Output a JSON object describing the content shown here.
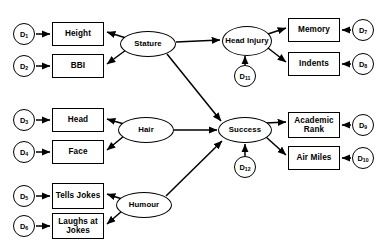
{
  "diagram": {
    "stroke_color": "#000000",
    "fill_color": "#ffffff"
  },
  "latent_factors": [
    {
      "id": "stature",
      "label": "Stature",
      "cx": 148,
      "cy": 44,
      "rx": 28,
      "ry": 13
    },
    {
      "id": "hair",
      "label": "Hair",
      "cx": 146,
      "cy": 130,
      "rx": 28,
      "ry": 13
    },
    {
      "id": "humour",
      "label": "Humour",
      "cx": 144,
      "cy": 205,
      "rx": 28,
      "ry": 13
    },
    {
      "id": "head-injury",
      "label": "Head Injury",
      "cx": 247,
      "cy": 41,
      "rx": 25,
      "ry": 15
    },
    {
      "id": "success",
      "label": "Success",
      "cx": 245,
      "cy": 130,
      "rx": 27,
      "ry": 13
    }
  ],
  "indicators": [
    {
      "id": "height",
      "label": "Height",
      "x": 52,
      "y": 22,
      "w": 52,
      "h": 24
    },
    {
      "id": "bbi",
      "label": "BBI",
      "x": 52,
      "y": 54,
      "w": 52,
      "h": 24
    },
    {
      "id": "head",
      "label": "Head",
      "x": 52,
      "y": 108,
      "w": 52,
      "h": 24
    },
    {
      "id": "face",
      "label": "Face",
      "x": 52,
      "y": 140,
      "w": 52,
      "h": 24
    },
    {
      "id": "tells-jokes",
      "label": "Tells Jokes",
      "x": 52,
      "y": 183,
      "w": 52,
      "h": 26
    },
    {
      "id": "laughs-jokes",
      "label": "Laughs at Jokes",
      "x": 52,
      "y": 213,
      "w": 52,
      "h": 26
    },
    {
      "id": "memory",
      "label": "Memory",
      "x": 288,
      "y": 18,
      "w": 52,
      "h": 24
    },
    {
      "id": "indents",
      "label": "Indents",
      "x": 288,
      "y": 52,
      "w": 52,
      "h": 24
    },
    {
      "id": "academic-rank",
      "label": "Academic Rank",
      "x": 288,
      "y": 112,
      "w": 52,
      "h": 26
    },
    {
      "id": "air-miles",
      "label": "Air Miles",
      "x": 288,
      "y": 146,
      "w": 52,
      "h": 24
    }
  ],
  "disturbances": [
    {
      "id": "d1",
      "label": "D",
      "subscript": "1",
      "cx": 24,
      "cy": 34,
      "r": 11
    },
    {
      "id": "d2",
      "label": "D",
      "subscript": "2",
      "cx": 24,
      "cy": 66,
      "r": 11
    },
    {
      "id": "d3",
      "label": "D",
      "subscript": "3",
      "cx": 24,
      "cy": 120,
      "r": 11
    },
    {
      "id": "d4",
      "label": "D",
      "subscript": "4",
      "cx": 24,
      "cy": 152,
      "r": 11
    },
    {
      "id": "d5",
      "label": "D",
      "subscript": "5",
      "cx": 24,
      "cy": 196,
      "r": 11
    },
    {
      "id": "d6",
      "label": "D",
      "subscript": "6",
      "cx": 24,
      "cy": 226,
      "r": 11
    },
    {
      "id": "d7",
      "label": "D",
      "subscript": "7",
      "cx": 363,
      "cy": 30,
      "r": 11
    },
    {
      "id": "d8",
      "label": "D",
      "subscript": "8",
      "cx": 363,
      "cy": 64,
      "r": 11
    },
    {
      "id": "d9",
      "label": "D",
      "subscript": "9",
      "cx": 363,
      "cy": 125,
      "r": 11
    },
    {
      "id": "d10",
      "label": "D",
      "subscript": "10",
      "cx": 363,
      "cy": 158,
      "r": 11
    },
    {
      "id": "d11",
      "label": "D",
      "subscript": "11",
      "cx": 245,
      "cy": 76,
      "r": 11
    },
    {
      "id": "d12",
      "label": "D",
      "subscript": "12",
      "cx": 245,
      "cy": 167,
      "r": 11
    }
  ],
  "edges": [
    {
      "from": "d1",
      "to": "height",
      "x1": 36,
      "y1": 34,
      "x2": 50,
      "y2": 34
    },
    {
      "from": "d2",
      "to": "bbi",
      "x1": 36,
      "y1": 66,
      "x2": 50,
      "y2": 66
    },
    {
      "from": "d3",
      "to": "head",
      "x1": 36,
      "y1": 120,
      "x2": 50,
      "y2": 120
    },
    {
      "from": "d4",
      "to": "face",
      "x1": 36,
      "y1": 152,
      "x2": 50,
      "y2": 152
    },
    {
      "from": "d5",
      "to": "tells-jokes",
      "x1": 36,
      "y1": 196,
      "x2": 50,
      "y2": 196
    },
    {
      "from": "d6",
      "to": "laughs-jokes",
      "x1": 36,
      "y1": 226,
      "x2": 50,
      "y2": 226
    },
    {
      "from": "stature",
      "to": "height",
      "x1": 126,
      "y1": 38,
      "x2": 107,
      "y2": 32
    },
    {
      "from": "stature",
      "to": "bbi",
      "x1": 126,
      "y1": 50,
      "x2": 107,
      "y2": 64
    },
    {
      "from": "hair",
      "to": "head",
      "x1": 124,
      "y1": 124,
      "x2": 107,
      "y2": 119
    },
    {
      "from": "hair",
      "to": "face",
      "x1": 124,
      "y1": 136,
      "x2": 107,
      "y2": 150
    },
    {
      "from": "humour",
      "to": "tells-jokes",
      "x1": 122,
      "y1": 199,
      "x2": 107,
      "y2": 194
    },
    {
      "from": "humour",
      "to": "laughs-jokes",
      "x1": 122,
      "y1": 211,
      "x2": 107,
      "y2": 224
    },
    {
      "from": "stature",
      "to": "head-injury",
      "x1": 176,
      "y1": 42,
      "x2": 220,
      "y2": 40
    },
    {
      "from": "stature",
      "to": "success",
      "x1": 167,
      "y1": 54,
      "x2": 221,
      "y2": 121
    },
    {
      "from": "hair",
      "to": "success",
      "x1": 174,
      "y1": 130,
      "x2": 217,
      "y2": 130
    },
    {
      "from": "humour",
      "to": "success",
      "x1": 166,
      "y1": 196,
      "x2": 222,
      "y2": 141
    },
    {
      "from": "d11",
      "to": "head-injury",
      "x1": 245,
      "y1": 65,
      "x2": 245,
      "y2": 56
    },
    {
      "from": "d12",
      "to": "success",
      "x1": 245,
      "y1": 156,
      "x2": 245,
      "y2": 144
    },
    {
      "from": "head-injury",
      "to": "memory",
      "x1": 268,
      "y1": 34,
      "x2": 286,
      "y2": 28
    },
    {
      "from": "head-injury",
      "to": "indents",
      "x1": 268,
      "y1": 48,
      "x2": 286,
      "y2": 62
    },
    {
      "from": "success",
      "to": "academic-rank",
      "x1": 266,
      "y1": 123,
      "x2": 286,
      "y2": 122
    },
    {
      "from": "success",
      "to": "air-miles",
      "x1": 266,
      "y1": 137,
      "x2": 286,
      "y2": 155
    },
    {
      "from": "d7",
      "to": "memory",
      "x1": 351,
      "y1": 30,
      "x2": 342,
      "y2": 30
    },
    {
      "from": "d8",
      "to": "indents",
      "x1": 351,
      "y1": 64,
      "x2": 342,
      "y2": 64
    },
    {
      "from": "d9",
      "to": "academic-rank",
      "x1": 351,
      "y1": 125,
      "x2": 342,
      "y2": 125
    },
    {
      "from": "d10",
      "to": "air-miles",
      "x1": 351,
      "y1": 158,
      "x2": 342,
      "y2": 158
    }
  ]
}
